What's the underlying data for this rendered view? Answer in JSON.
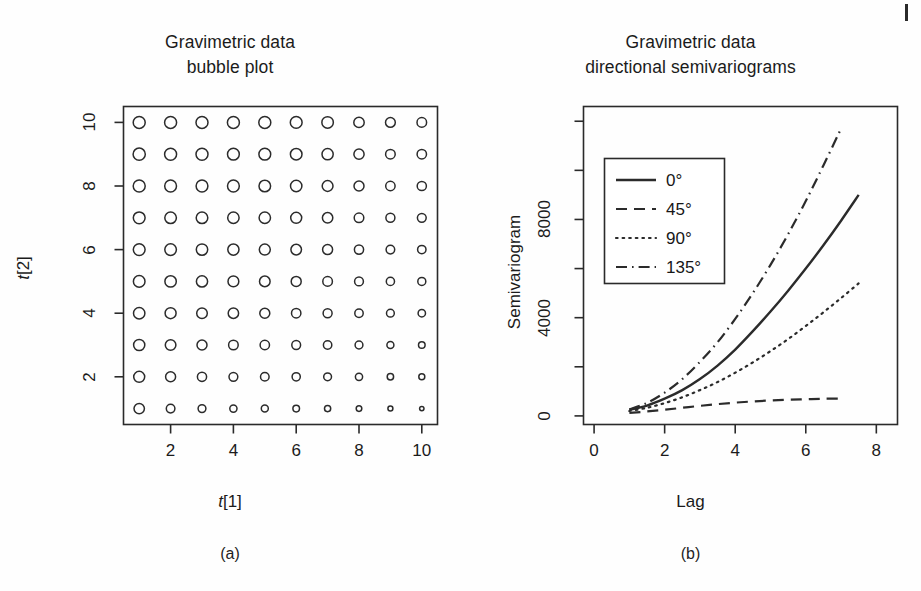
{
  "figure": {
    "panels": [
      {
        "id": "a",
        "caption": "(a)",
        "title_line1": "Gravimetric data",
        "title_line2": "bubble plot",
        "x_axis_title": "t[1]",
        "y_axis_title": "t[2]"
      },
      {
        "id": "b",
        "caption": "(b)",
        "title_line1": "Gravimetric data",
        "title_line2": "directional semivariograms",
        "x_axis_title": "Lag",
        "y_axis_title": "Semivariogram"
      }
    ]
  },
  "chart_data": [
    {
      "type": "scatter",
      "subtype": "bubble",
      "title": "Gravimetric data bubble plot",
      "xlabel": "t[1]",
      "ylabel": "t[2]",
      "xlim": [
        0.5,
        10.5
      ],
      "ylim": [
        0.5,
        10.5
      ],
      "xticks": [
        2,
        4,
        6,
        8,
        10
      ],
      "yticks": [
        2,
        4,
        6,
        8,
        10
      ],
      "grid": false,
      "legend": null,
      "marker": "open-circle",
      "note": "10 x 10 grid of open circles; bubble radius decreases toward bottom-right",
      "x": [
        1,
        2,
        3,
        4,
        5,
        6,
        7,
        8,
        9,
        10
      ],
      "y": [
        1,
        2,
        3,
        4,
        5,
        6,
        7,
        8,
        9,
        10
      ],
      "sizes_by_row_top_to_bottom": [
        [
          12.0,
          12.0,
          12.0,
          12.0,
          12.0,
          11.8,
          11.5,
          10.4,
          9.8,
          9.6
        ],
        [
          12.2,
          12.0,
          12.0,
          11.8,
          11.8,
          11.6,
          11.2,
          10.2,
          9.6,
          9.4
        ],
        [
          12.0,
          11.8,
          11.8,
          11.8,
          11.6,
          11.4,
          10.8,
          10.0,
          9.4,
          9.2
        ],
        [
          11.8,
          11.6,
          11.6,
          11.4,
          11.4,
          11.0,
          10.4,
          9.6,
          9.0,
          8.8
        ],
        [
          11.8,
          11.6,
          11.4,
          11.2,
          11.0,
          10.6,
          10.0,
          9.2,
          8.6,
          8.4
        ],
        [
          11.6,
          11.4,
          11.2,
          10.8,
          10.6,
          10.0,
          9.6,
          8.8,
          8.2,
          8.0
        ],
        [
          11.4,
          11.0,
          10.6,
          10.4,
          10.0,
          9.4,
          9.0,
          8.4,
          7.8,
          7.4
        ],
        [
          11.2,
          10.6,
          10.0,
          9.6,
          9.4,
          8.8,
          8.4,
          7.8,
          7.0,
          6.6
        ],
        [
          11.0,
          10.0,
          9.2,
          8.8,
          8.6,
          8.2,
          7.8,
          7.2,
          6.4,
          6.0
        ],
        [
          10.4,
          8.6,
          7.8,
          7.2,
          7.0,
          6.6,
          6.2,
          5.6,
          5.0,
          4.4
        ]
      ]
    },
    {
      "type": "line",
      "title": "Gravimetric data directional semivariograms",
      "xlabel": "Lag",
      "ylabel": "Semivariogram",
      "xlim": [
        -0.3,
        8.6
      ],
      "ylim": [
        -350,
        12600
      ],
      "xticks": [
        0,
        2,
        4,
        6,
        8
      ],
      "yticks": [
        0,
        4000,
        8000
      ],
      "yticks_minor": [
        2000,
        6000,
        10000,
        12000
      ],
      "grid": false,
      "legend_position": "top-left",
      "series": [
        {
          "name": "0°",
          "style": "solid",
          "x": [
            1.0,
            1.5,
            2.0,
            2.5,
            3.0,
            3.5,
            4.0,
            4.5,
            5.0,
            5.5,
            6.0,
            6.5,
            7.0,
            7.5
          ],
          "y": [
            250,
            420,
            700,
            1050,
            1500,
            2050,
            2700,
            3450,
            4250,
            5100,
            6000,
            6950,
            7950,
            9000
          ]
        },
        {
          "name": "45°",
          "style": "dashed",
          "x": [
            1.0,
            1.5,
            2.0,
            2.5,
            3.0,
            3.5,
            4.0,
            4.5,
            5.0,
            5.5,
            6.0,
            6.5,
            7.0
          ],
          "y": [
            120,
            180,
            250,
            330,
            410,
            480,
            540,
            590,
            630,
            660,
            680,
            700,
            700
          ]
        },
        {
          "name": "90°",
          "style": "dotted",
          "x": [
            1.0,
            1.5,
            2.0,
            2.5,
            3.0,
            3.5,
            4.0,
            4.5,
            5.0,
            5.5,
            6.0,
            6.5,
            7.0,
            7.5
          ],
          "y": [
            200,
            330,
            520,
            760,
            1050,
            1380,
            1760,
            2180,
            2640,
            3130,
            3660,
            4220,
            4800,
            5400
          ]
        },
        {
          "name": "135°",
          "style": "dashdot",
          "x": [
            1.0,
            1.5,
            2.0,
            2.5,
            3.0,
            3.5,
            4.0,
            4.5,
            5.0,
            5.5,
            6.0,
            6.5,
            7.0
          ],
          "y": [
            260,
            530,
            950,
            1500,
            2200,
            3000,
            3950,
            5000,
            6150,
            7400,
            8750,
            10200,
            11700
          ]
        }
      ],
      "legend_items": [
        {
          "label": "0°",
          "style": "solid"
        },
        {
          "label": "45°",
          "style": "dashed"
        },
        {
          "label": "90°",
          "style": "dotted"
        },
        {
          "label": "135°",
          "style": "dashdot"
        }
      ]
    }
  ],
  "colors": {
    "ink": "#1b1b1b",
    "background": "#ffffff",
    "axis": "#2a2a2a"
  }
}
